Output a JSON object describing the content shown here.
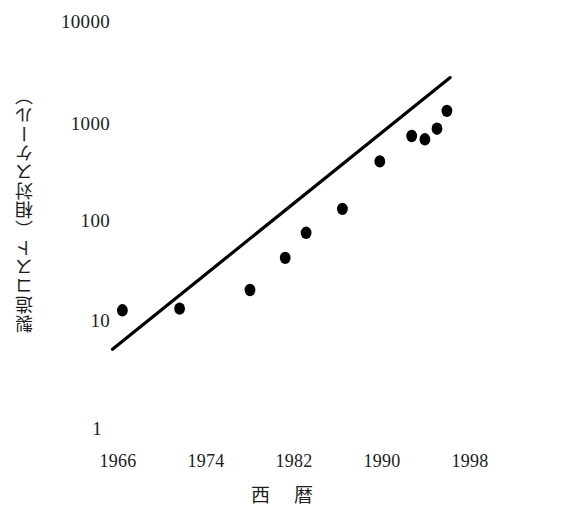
{
  "chart_data": {
    "type": "scatter",
    "title": "",
    "xlabel": "西 暦",
    "ylabel": "製造コスト（相対スケール）",
    "xlim": [
      1962,
      2002
    ],
    "ylim": [
      1,
      10000
    ],
    "yscale": "log",
    "grid": false,
    "legend": null,
    "xticks": [
      "1966",
      "1974",
      "1982",
      "1990",
      "1998"
    ],
    "xtick_values": [
      1966,
      1974,
      1982,
      1990,
      1998
    ],
    "yticks": [
      "1",
      "10",
      "100",
      "1000",
      "10000"
    ],
    "ytick_values": [
      1,
      10,
      100,
      1000,
      10000
    ],
    "series": [
      {
        "name": "製造コスト",
        "type": "scatter",
        "marker": "filled-circle",
        "color": "#000000",
        "points": [
          {
            "x": 1966.4,
            "y": 12.5
          },
          {
            "x": 1971.6,
            "y": 13.0
          },
          {
            "x": 1978.0,
            "y": 20.0
          },
          {
            "x": 1981.2,
            "y": 42.0
          },
          {
            "x": 1983.1,
            "y": 75.0
          },
          {
            "x": 1986.4,
            "y": 130.0
          },
          {
            "x": 1989.8,
            "y": 390.0
          },
          {
            "x": 1992.7,
            "y": 700.0
          },
          {
            "x": 1993.9,
            "y": 650.0
          },
          {
            "x": 1995.0,
            "y": 830.0
          },
          {
            "x": 1995.9,
            "y": 1250.0
          }
        ]
      },
      {
        "name": "近似直線",
        "type": "line",
        "color": "#000000",
        "points": [
          {
            "x": 1965.5,
            "y": 5.1
          },
          {
            "x": 1996.2,
            "y": 2700.0
          }
        ]
      }
    ]
  },
  "axes": {
    "y_title": "製造コスト（相対スケール）",
    "x_title": "西 暦"
  }
}
